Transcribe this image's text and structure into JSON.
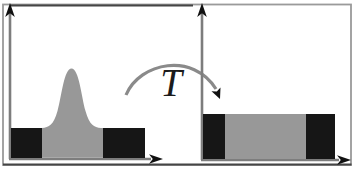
{
  "figure": {
    "type": "histogram-transformation-diagram",
    "transform_label": "T",
    "colors": {
      "background": "#ffffff",
      "frame": "#9a9a9a",
      "frame_dark_edge": "#454545",
      "axis": "#7d7d7d",
      "arrowhead": "#111111",
      "histogram_gray": "#989898",
      "histogram_dark": "#161616",
      "transform_arrow": "#8a8a8a",
      "label_ink": "#1b1b1b"
    },
    "left_panel": {
      "kind": "narrow-peaked-distribution",
      "baseline_y": 159,
      "bell": {
        "x_from": 42,
        "x_to": 103,
        "peak_x": 71,
        "peak_top_y": 68,
        "tail_top_y": 128
      },
      "dark_blocks": [
        {
          "x": 11,
          "y": 128,
          "w": 31,
          "h": 30
        },
        {
          "x": 103,
          "y": 128,
          "w": 42,
          "h": 30
        }
      ]
    },
    "right_panel": {
      "kind": "uniform-distribution",
      "baseline_y": 160,
      "flat_top_y": 114,
      "dark_blocks": [
        {
          "x": 203,
          "y": 114,
          "w": 22,
          "h": 45
        },
        {
          "x": 306,
          "y": 114,
          "w": 29,
          "h": 45
        }
      ],
      "gray_block": {
        "x": 225,
        "y": 114,
        "w": 81,
        "h": 45
      }
    }
  }
}
